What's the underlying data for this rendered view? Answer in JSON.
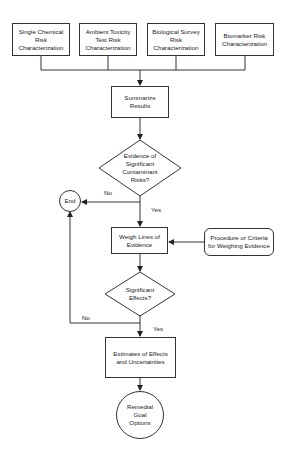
{
  "diagram": {
    "sources": [
      {
        "label": "Single Chemical\nRisk\nCharacterization"
      },
      {
        "label": "Ambient Toxicity\nTest Risk\nCharacterization"
      },
      {
        "label": "Biological Survey\nRisk\nCharacterization"
      },
      {
        "label": "Biomarker Risk\nCharacterization"
      }
    ],
    "summarize": "Summarize\nResults",
    "decision1": "Evidence of\nSignificant\nContaminant\nRisks?",
    "end": "End",
    "weigh": "Weigh Lines of\nEvidence",
    "procedure": "Procedure or Criteria\nfor Weighing Evidence",
    "decision2": "Significant\nEffects?",
    "estimates": "Estimates of Effects\nand Uncertainties",
    "remedial": "Remedial\nGoal\nOptions",
    "edges": {
      "d1_no": "No",
      "d1_yes": "Yes",
      "d2_no": "No",
      "d2_yes": "Yes"
    },
    "colors": {
      "stroke": "#333333",
      "fill": "#ffffff"
    }
  }
}
